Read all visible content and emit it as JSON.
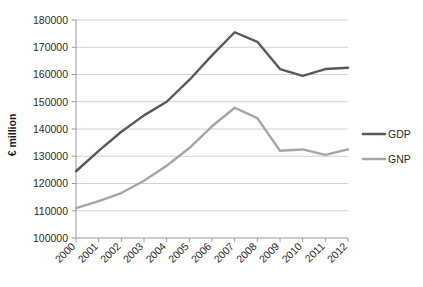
{
  "chart_data": {
    "type": "line",
    "title": "",
    "xlabel": "",
    "ylabel": "€ million",
    "categories": [
      "2000",
      "2001",
      "2002",
      "2003",
      "2004",
      "2005",
      "2006",
      "2007",
      "2008",
      "2009",
      "2010",
      "2011",
      "2012"
    ],
    "x": [
      2000,
      2001,
      2002,
      2003,
      2004,
      2005,
      2006,
      2007,
      2008,
      2009,
      2010,
      2011,
      2012
    ],
    "ylim": [
      100000,
      180000
    ],
    "yticks": [
      100000,
      110000,
      120000,
      130000,
      140000,
      150000,
      160000,
      170000,
      180000
    ],
    "ytick_labels": [
      "100000",
      "110000",
      "120000",
      "130000",
      "140000",
      "150000",
      "160000",
      "170000",
      "180000"
    ],
    "grid": true,
    "legend_position": "right",
    "series": [
      {
        "name": "GDP",
        "color": "#595959",
        "values": [
          124500,
          132000,
          139000,
          145000,
          150000,
          158000,
          167000,
          175500,
          172000,
          162000,
          159500,
          162000,
          162500
        ]
      },
      {
        "name": "GNP",
        "color": "#a6a6a6",
        "values": [
          111000,
          113500,
          116500,
          121000,
          126500,
          133000,
          141000,
          147800,
          144000,
          132000,
          132500,
          130500,
          132500
        ]
      }
    ]
  },
  "legend": {
    "items": [
      {
        "label": "GDP"
      },
      {
        "label": "GNP"
      }
    ]
  },
  "colors": {
    "gdp": "#595959",
    "gnp": "#a6a6a6",
    "grid": "#d2d2d2",
    "axis": "#9a9a9a",
    "text": "#2b2b2b",
    "background": "#ffffff"
  }
}
